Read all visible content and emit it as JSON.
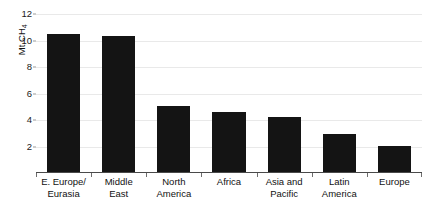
{
  "chart_data": {
    "type": "bar",
    "title": "",
    "xlabel": "",
    "ylabel": "Mt CH4",
    "ylabel_prefix": "Mt CH",
    "ylabel_subscript": "4",
    "ylim": [
      0,
      12
    ],
    "yticks": [
      2,
      4,
      6,
      8,
      10,
      12
    ],
    "ytick_labels": [
      "2",
      "4",
      "6",
      "8",
      "10",
      "12"
    ],
    "grid": true,
    "legend": null,
    "bar_color": "#141414",
    "gridline_color": "#e9e9e9",
    "axis_color": "#4a4a4a",
    "categories": [
      "E. Europe/\nEurasia",
      "Middle\nEast",
      "North\nAmerica",
      "Africa",
      "Asia and\nPacific",
      "Latin\nAmerica",
      "Europe"
    ],
    "values": [
      10.45,
      10.3,
      5.0,
      4.5,
      4.15,
      2.9,
      1.95
    ]
  }
}
